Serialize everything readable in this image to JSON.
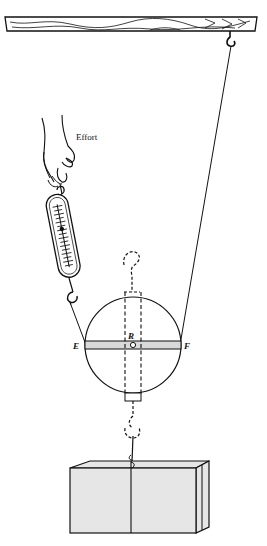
{
  "diagram": {
    "type": "wheel-and-axle pulley demonstration",
    "labels": {
      "effort": "Effort",
      "left_point": "E",
      "right_point": "F",
      "center_point": "R"
    },
    "components": [
      {
        "name": "ceiling-beam",
        "description": "wooden beam with grain across top"
      },
      {
        "name": "ceiling-hook",
        "description": "hook hanging from beam at right"
      },
      {
        "name": "hand",
        "description": "hand pulling spring balance (effort)"
      },
      {
        "name": "spring-balance",
        "description": "spring scale with graduated markings"
      },
      {
        "name": "wheel",
        "description": "circular wheel with horizontal bar EF and dashed axle through center R"
      },
      {
        "name": "load-hook",
        "description": "dashed hook beneath wheel axle"
      },
      {
        "name": "load-box",
        "description": "tied box as load"
      }
    ],
    "colors": {
      "line": "#111111",
      "bar_fill": "#d9d9d9",
      "box_fill": "#e6e6e6",
      "background": "#ffffff"
    }
  }
}
